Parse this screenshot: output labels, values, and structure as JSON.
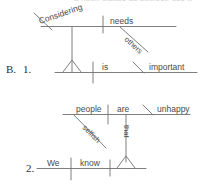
{
  "page": {
    "clipped_header_text": "a noun clause as subject, use it",
    "width": 209,
    "height": 184,
    "ink_color": "#6f6f6f",
    "text_color": "#4a4a4a"
  },
  "exercises": [
    {
      "section_marker": "B.",
      "item_marker": "1.",
      "diagram_name": "diagram-considering-needs-others",
      "main_clause": {
        "subject_placeholder": "Δ",
        "verb": "is",
        "predicate_adjective": "important"
      },
      "subject_clause": {
        "gerund": "Considering",
        "direct_object": "needs",
        "modifier": "others"
      },
      "labels": {
        "considering": "Considering",
        "needs": "needs",
        "others": "others",
        "is": "is",
        "important": "important"
      }
    },
    {
      "section_marker": "",
      "item_marker": "2.",
      "diagram_name": "diagram-we-know-that-people-are-unhappy",
      "main_clause": {
        "subject": "We",
        "verb": "know",
        "object_placeholder": "Δ"
      },
      "noun_clause": {
        "connector": "that",
        "subject": "people",
        "verb": "are",
        "predicate_adjective": "unhappy",
        "modifier": "selfish"
      },
      "labels": {
        "people": "people",
        "are": "are",
        "unhappy": "unhappy",
        "selfish": "selfish",
        "that": "that",
        "we": "We",
        "know": "know"
      }
    }
  ]
}
